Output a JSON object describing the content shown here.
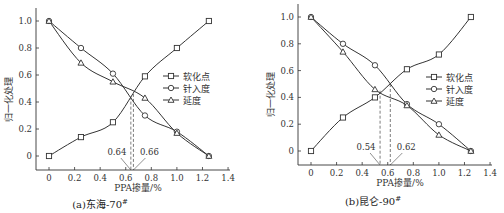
{
  "chart_data": [
    {
      "type": "line",
      "id": "a",
      "title": "(a)东海-70#",
      "caption_main": "(a)东海-70",
      "caption_sup": "#",
      "xlabel": "PPA掺量/%",
      "ylabel": "归一化处理",
      "xlim": [
        -0.1,
        1.4
      ],
      "ylim": [
        -0.1,
        1.1
      ],
      "xticks": [
        "0",
        "0.2",
        "0.4",
        "0.6",
        "0.8",
        "1.0",
        "1.2",
        "1.4"
      ],
      "yticks": [
        "0",
        "0.2",
        "0.4",
        "0.6",
        "0.8",
        "1.0"
      ],
      "x": [
        0,
        0.25,
        0.5,
        0.75,
        1.0,
        1.25
      ],
      "series": [
        {
          "name": "软化点",
          "marker": "square",
          "values": [
            0.0,
            0.14,
            0.25,
            0.59,
            0.8,
            1.0
          ]
        },
        {
          "name": "针入度",
          "marker": "circle",
          "values": [
            1.0,
            0.8,
            0.61,
            0.3,
            0.18,
            0.0
          ]
        },
        {
          "name": "延度",
          "marker": "triangle",
          "values": [
            1.0,
            0.69,
            0.55,
            0.43,
            0.17,
            0.0
          ]
        }
      ],
      "annotations": [
        {
          "label": "0.64",
          "x": 0.64,
          "y": 0.44
        },
        {
          "label": "0.66",
          "x": 0.66,
          "y": 0.46
        }
      ],
      "grid": false,
      "legend_position": "right"
    },
    {
      "type": "line",
      "id": "b",
      "title": "(b)昆仑-90#",
      "caption_main": "(b)昆仑-90",
      "caption_sup": "#",
      "xlabel": "PPA掺量/%",
      "ylabel": "归一化处理",
      "xlim": [
        -0.1,
        1.4
      ],
      "ylim": [
        -0.1,
        1.1
      ],
      "xticks": [
        "0",
        "0.2",
        "0.4",
        "0.6",
        "0.8",
        "1.0",
        "1.2",
        "1.4"
      ],
      "yticks": [
        "0",
        "0.2",
        "0.4",
        "0.6",
        "0.8",
        "1.0"
      ],
      "x": [
        0,
        0.25,
        0.5,
        0.75,
        1.0,
        1.25
      ],
      "series": [
        {
          "name": "软化点",
          "marker": "square",
          "values": [
            0.0,
            0.25,
            0.4,
            0.61,
            0.72,
            1.0
          ]
        },
        {
          "name": "针入度",
          "marker": "circle",
          "values": [
            1.0,
            0.8,
            0.64,
            0.35,
            0.2,
            0.0
          ]
        },
        {
          "name": "延度",
          "marker": "triangle",
          "values": [
            1.0,
            0.74,
            0.46,
            0.34,
            0.12,
            0.0
          ]
        }
      ],
      "annotations": [
        {
          "label": "0.54",
          "x": 0.54,
          "y": 0.45
        },
        {
          "label": "0.62",
          "x": 0.62,
          "y": 0.5
        }
      ],
      "grid": false,
      "legend_position": "right"
    }
  ],
  "colors": {
    "line": "#333333",
    "text": "#333333",
    "background": "#ffffff"
  }
}
